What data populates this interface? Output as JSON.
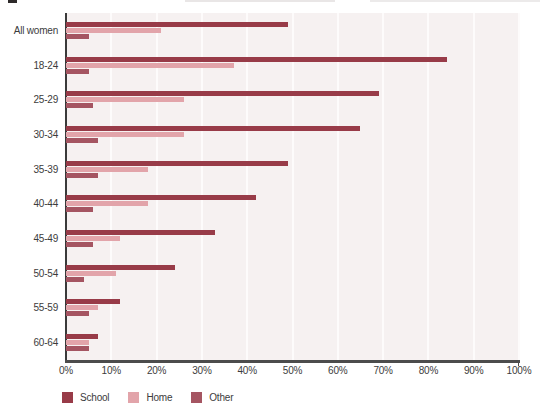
{
  "chart_data": {
    "type": "bar",
    "orientation": "horizontal",
    "title": "",
    "categories": [
      "All women",
      "18-24",
      "25-29",
      "30-34",
      "35-39",
      "40-44",
      "45-49",
      "50-54",
      "55-59",
      "60-64"
    ],
    "series": [
      {
        "name": "School",
        "color": "#983b48",
        "values": [
          49,
          84,
          69,
          65,
          49,
          42,
          33,
          24,
          12,
          7
        ]
      },
      {
        "name": "Home",
        "color": "#e2a4aa",
        "values": [
          21,
          37,
          26,
          26,
          18,
          18,
          12,
          11,
          7,
          5
        ]
      },
      {
        "name": "Other",
        "color": "#a55562",
        "values": [
          5,
          5,
          6,
          7,
          7,
          6,
          6,
          4,
          5,
          5
        ]
      }
    ],
    "xlabel": "",
    "ylabel": "",
    "x_axis": {
      "min": 0,
      "max": 100,
      "tick_step": 10,
      "tick_labels": [
        "0%",
        "10%",
        "20%",
        "30%",
        "40%",
        "50%",
        "60%",
        "70%",
        "80%",
        "90%",
        "100%"
      ]
    },
    "legend": [
      "School",
      "Home",
      "Other"
    ],
    "legend_position": "bottom-left",
    "grid": true,
    "colors": {
      "plot_background": "#f6f1f1",
      "gridline": "#fdfbfb",
      "axis": "#4c4c4c",
      "text": "#3c3c3c"
    }
  }
}
